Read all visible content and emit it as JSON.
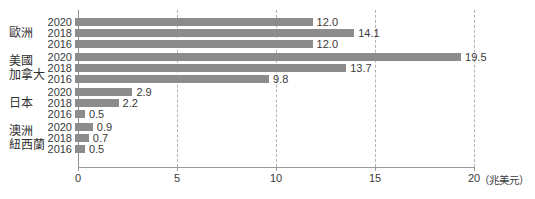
{
  "chart_data": {
    "type": "bar",
    "orientation": "horizontal",
    "title": "",
    "unit_label": "（兆美元）",
    "xlim": [
      0,
      20
    ],
    "x_ticks": [
      0,
      5,
      10,
      15,
      20
    ],
    "grid_ticks": [
      5,
      10,
      15,
      20
    ],
    "legend": "none",
    "bar_color": "#8c8c8c",
    "text_color": "#3a3a3a",
    "background_color": "#ffffff",
    "categories_note": "each region group has three bars for years 2020/2018/2016 top-to-bottom",
    "groups": [
      {
        "label_lines": [
          "歐洲"
        ],
        "years": [
          "2020",
          "2018",
          "2016"
        ],
        "values": [
          12.0,
          14.1,
          12.0
        ],
        "value_labels": [
          "12.0",
          "14.1",
          "12.0"
        ]
      },
      {
        "label_lines": [
          "美國",
          "加拿大"
        ],
        "years": [
          "2020",
          "2018",
          "2016"
        ],
        "values": [
          19.5,
          13.7,
          9.8
        ],
        "value_labels": [
          "19.5",
          "13.7",
          "9.8"
        ]
      },
      {
        "label_lines": [
          "日本"
        ],
        "years": [
          "2020",
          "2018",
          "2016"
        ],
        "values": [
          2.9,
          2.2,
          0.5
        ],
        "value_labels": [
          "2.9",
          "2.2",
          "0.5"
        ]
      },
      {
        "label_lines": [
          "澳洲",
          "紐西蘭"
        ],
        "years": [
          "2020",
          "2018",
          "2016"
        ],
        "values": [
          0.9,
          0.7,
          0.5
        ],
        "value_labels": [
          "0.9",
          "0.7",
          "0.5"
        ]
      }
    ]
  }
}
